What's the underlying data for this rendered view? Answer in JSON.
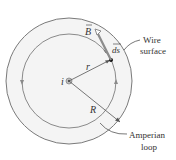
{
  "labels": {
    "current": "i",
    "radius_r": "r",
    "radius_R": "R",
    "field": "B",
    "element": "ds",
    "wire_surface_line1": "Wire",
    "wire_surface_line2": "surface",
    "amperian_line1": "Amperian",
    "amperian_line2": "loop"
  },
  "colors": {
    "circle": "#7a7a7a",
    "arrow": "#8c8c8c",
    "text": "#333333",
    "wire_fill": "#f2f2f2"
  }
}
